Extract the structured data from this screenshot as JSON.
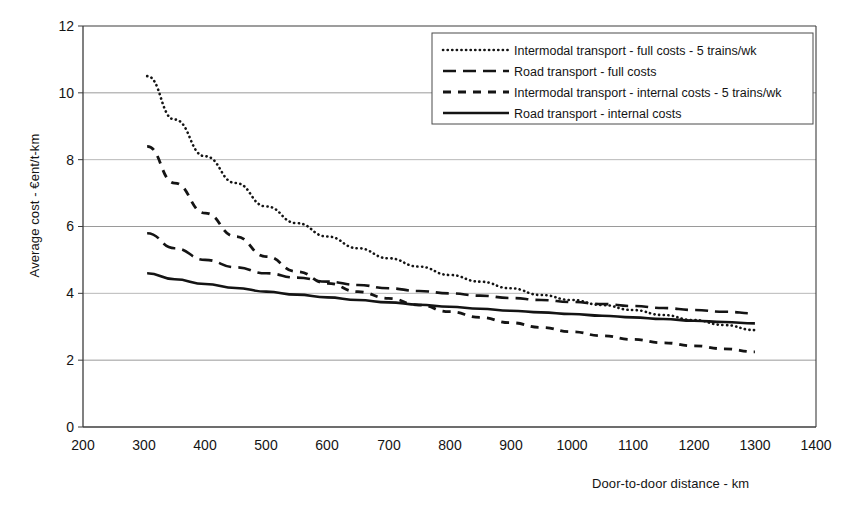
{
  "chart_data": {
    "type": "line",
    "title": "",
    "xlabel": "Door-to-door distance - km",
    "ylabel": "Average cost - €ent/t-km",
    "xlim": [
      200,
      1400
    ],
    "ylim": [
      0,
      12
    ],
    "xticks": [
      200,
      300,
      400,
      500,
      600,
      700,
      800,
      900,
      1000,
      1100,
      1200,
      1300,
      1400
    ],
    "yticks": [
      0,
      2,
      4,
      6,
      8,
      10,
      12
    ],
    "grid": "horizontal",
    "legend_position": "top-center-right",
    "series": [
      {
        "name": "Intermodal transport - full costs - 5 trains/wk",
        "style": "dotted",
        "x": [
          305,
          350,
          400,
          450,
          500,
          550,
          600,
          650,
          700,
          750,
          800,
          850,
          900,
          950,
          1000,
          1050,
          1100,
          1150,
          1200,
          1250,
          1300
        ],
        "values": [
          10.5,
          9.2,
          8.1,
          7.3,
          6.6,
          6.1,
          5.7,
          5.35,
          5.05,
          4.8,
          4.55,
          4.35,
          4.15,
          3.95,
          3.8,
          3.65,
          3.5,
          3.35,
          3.2,
          3.05,
          2.9
        ]
      },
      {
        "name": "Road transport - full costs",
        "style": "long-dash",
        "x": [
          305,
          350,
          400,
          450,
          500,
          550,
          600,
          650,
          700,
          750,
          800,
          850,
          900,
          950,
          1000,
          1050,
          1100,
          1150,
          1200,
          1250,
          1300
        ],
        "values": [
          5.8,
          5.35,
          5.0,
          4.78,
          4.6,
          4.47,
          4.35,
          4.25,
          4.15,
          4.07,
          4.0,
          3.93,
          3.86,
          3.8,
          3.74,
          3.68,
          3.62,
          3.56,
          3.5,
          3.45,
          3.4
        ]
      },
      {
        "name": "Intermodal transport - internal costs - 5 trains/wk",
        "style": "short-dash",
        "x": [
          305,
          350,
          400,
          450,
          500,
          550,
          600,
          650,
          700,
          750,
          800,
          850,
          900,
          950,
          1000,
          1050,
          1100,
          1150,
          1200,
          1250,
          1300
        ],
        "values": [
          8.4,
          7.3,
          6.4,
          5.7,
          5.1,
          4.65,
          4.3,
          4.05,
          3.85,
          3.65,
          3.45,
          3.28,
          3.12,
          2.98,
          2.85,
          2.73,
          2.62,
          2.52,
          2.43,
          2.34,
          2.25
        ]
      },
      {
        "name": "Road transport - internal costs",
        "style": "solid",
        "x": [
          305,
          350,
          400,
          450,
          500,
          550,
          600,
          650,
          700,
          750,
          800,
          850,
          900,
          950,
          1000,
          1050,
          1100,
          1150,
          1200,
          1250,
          1300
        ],
        "values": [
          4.6,
          4.42,
          4.28,
          4.16,
          4.05,
          3.96,
          3.88,
          3.8,
          3.73,
          3.66,
          3.6,
          3.54,
          3.48,
          3.43,
          3.38,
          3.33,
          3.28,
          3.23,
          3.18,
          3.14,
          3.1
        ]
      }
    ],
    "legend": [
      "Intermodal transport - full costs - 5 trains/wk",
      "Road transport - full costs",
      "Intermodal transport - internal costs - 5 trains/wk",
      "Road transport - internal costs"
    ]
  },
  "axes": {
    "ylabel": "Average cost - €ent/t-km",
    "xlabel": "Door-to-door distance - km",
    "yticks": [
      "0",
      "2",
      "4",
      "6",
      "8",
      "10",
      "12"
    ],
    "xticks": [
      "200",
      "300",
      "400",
      "500",
      "600",
      "700",
      "800",
      "900",
      "1000",
      "1100",
      "1200",
      "1300",
      "1400"
    ]
  },
  "colors": {
    "ink": "#141414",
    "grid": "#9a9a9a",
    "frame": "#3c3c3c",
    "background": "#ffffff"
  }
}
